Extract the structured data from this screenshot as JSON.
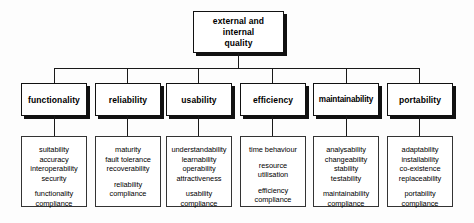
{
  "diagram": {
    "title": "external and internal quality",
    "root": {
      "label_lines": [
        "external and",
        "internal",
        "quality"
      ],
      "label": "external and internal quality"
    },
    "characteristics": [
      {
        "name": "functionality",
        "subcharacteristics": [
          "suitability",
          "accuracy",
          "interoperability",
          "security"
        ],
        "compliance": [
          "functionality",
          "compliance"
        ]
      },
      {
        "name": "reliability",
        "subcharacteristics": [
          "maturity",
          "fault tolerance",
          "recoverability"
        ],
        "compliance": [
          "reliability",
          "compliance"
        ]
      },
      {
        "name": "usability",
        "subcharacteristics": [
          "understandability",
          "learnability",
          "operability",
          "attractiveness"
        ],
        "compliance": [
          "usability",
          "compliance"
        ]
      },
      {
        "name": "efficiency",
        "subcharacteristics": [
          "time behaviour",
          "",
          "resource",
          "utilisation"
        ],
        "compliance": [
          "efficiency",
          "compliance"
        ]
      },
      {
        "name": "maintainability",
        "subcharacteristics": [
          "analysability",
          "changeability",
          "stability",
          "testability"
        ],
        "compliance": [
          "maintainability",
          "compliance"
        ]
      },
      {
        "name": "portability",
        "subcharacteristics": [
          "adaptability",
          "installability",
          "co-existence",
          "replaceability"
        ],
        "compliance": [
          "portability",
          "compliance"
        ]
      }
    ]
  },
  "colors": {
    "background": "#fdfdfd",
    "border": "#111111",
    "shadow": "#111111",
    "text": "#000000",
    "connector": "#1a1a1a"
  }
}
